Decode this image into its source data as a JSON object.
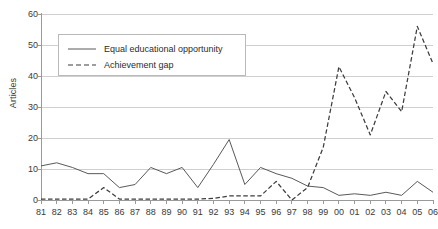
{
  "chart_data": {
    "type": "line",
    "title": "",
    "subtitle": "",
    "xlabel": "",
    "ylabel": "Articles",
    "categories": [
      "81",
      "82",
      "83",
      "84",
      "85",
      "86",
      "87",
      "88",
      "89",
      "90",
      "91",
      "92",
      "93",
      "94",
      "95",
      "96",
      "97",
      "98",
      "99",
      "00",
      "01",
      "02",
      "03",
      "04",
      "05",
      "06"
    ],
    "x_tick_labels": [
      "81",
      "82",
      "83",
      "84",
      "85",
      "86",
      "87",
      "88",
      "89",
      "90",
      "91",
      "92",
      "93",
      "94",
      "95",
      "96",
      "97",
      "98",
      "99",
      "00",
      "01",
      "02",
      "03",
      "04",
      "05",
      "06"
    ],
    "y_tick_labels": [
      "0",
      "10",
      "20",
      "30",
      "40",
      "50",
      "60"
    ],
    "y_ticks": [
      0,
      10,
      20,
      30,
      40,
      50,
      60
    ],
    "ylim": [
      0,
      60
    ],
    "xlim_index": [
      0,
      25
    ],
    "grid": "horizontal",
    "legend_position": "upper-left-inside",
    "series": [
      {
        "name": "Equal educational opportunity",
        "style": "solid",
        "color": "#595959",
        "values": [
          11,
          12,
          10.5,
          8.5,
          8.5,
          4,
          5,
          10.5,
          8.5,
          10.5,
          4,
          11.5,
          19.5,
          5,
          10.5,
          8.5,
          7,
          4.5,
          4,
          1.5,
          2,
          1.5,
          2.5,
          1.5,
          6,
          2.5
        ]
      },
      {
        "name": "Achievement gap",
        "style": "dashed",
        "color": "#3d3d3d",
        "values": [
          0.3,
          0.3,
          0.3,
          0.3,
          4,
          0.3,
          0.3,
          0.3,
          0.3,
          0.3,
          0.3,
          0.5,
          1.3,
          1.3,
          1.3,
          6,
          0,
          4,
          17,
          43,
          33,
          21,
          35,
          28.5,
          56,
          44
        ]
      }
    ]
  },
  "legend": {
    "items": [
      {
        "label": "Equal educational opportunity",
        "style": "solid"
      },
      {
        "label": "Achievement gap",
        "style": "dashed"
      }
    ]
  },
  "axes": {
    "y_axis_title": "Articles"
  },
  "colors": {
    "gridline": "#d0d0d0",
    "axis": "#9a9a9a",
    "series_solid": "#595959",
    "series_dashed": "#3d3d3d",
    "text": "#3a3a3a",
    "background": "#ffffff"
  }
}
